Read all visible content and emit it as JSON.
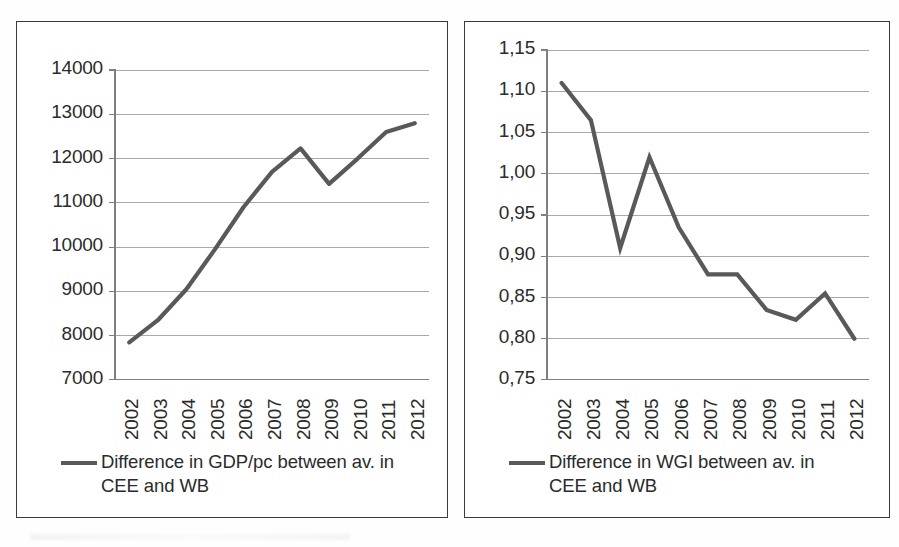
{
  "figure": {
    "background_color": "#ffffff",
    "line_color": "#595959",
    "gridline_color": "#a9a9a9",
    "axis_color": "#7f7f7f",
    "frame_color": "#3a3a3a",
    "text_color": "#2b2b2b"
  },
  "chart_data": [
    {
      "id": "gdp-chart",
      "type": "line",
      "title": "",
      "xlabel": "",
      "ylabel": "",
      "categories": [
        "2002",
        "2003",
        "2004",
        "2005",
        "2006",
        "2007",
        "2008",
        "2009",
        "2010",
        "2011",
        "2012"
      ],
      "series": [
        {
          "name": "Difference in GDP/pc between av. in CEE and WB",
          "values": [
            7850,
            8350,
            9050,
            9950,
            10900,
            11700,
            12230,
            11430,
            12000,
            12600,
            12800
          ]
        }
      ],
      "yticks": [
        7000,
        8000,
        9000,
        10000,
        11000,
        12000,
        13000,
        14000
      ],
      "ytick_labels": [
        "7000",
        "8000",
        "9000",
        "10000",
        "11000",
        "12000",
        "13000",
        "14000"
      ],
      "ylim": [
        7000,
        14000
      ],
      "grid": true,
      "legend_position": "bottom",
      "legend": [
        "Difference in GDP/pc between av. in CEE and WB"
      ]
    },
    {
      "id": "wgi-chart",
      "type": "line",
      "title": "",
      "xlabel": "",
      "ylabel": "",
      "categories": [
        "2002",
        "2003",
        "2004",
        "2005",
        "2006",
        "2007",
        "2008",
        "2009",
        "2010",
        "2011",
        "2012"
      ],
      "series": [
        {
          "name": "Difference in WGI between av. in CEE and WB",
          "values": [
            1.11,
            1.065,
            0.91,
            1.02,
            0.935,
            0.878,
            0.878,
            0.835,
            0.823,
            0.855,
            0.8
          ]
        }
      ],
      "yticks": [
        0.75,
        0.8,
        0.85,
        0.9,
        0.95,
        1.0,
        1.05,
        1.1,
        1.15
      ],
      "ytick_labels": [
        "0,75",
        "0,80",
        "0,85",
        "0,90",
        "0,95",
        "1,00",
        "1,05",
        "1,10",
        "1,15"
      ],
      "ylim": [
        0.75,
        1.15
      ],
      "grid": true,
      "legend_position": "bottom",
      "legend": [
        "Difference in WGI between av. in CEE and WB"
      ]
    }
  ],
  "left_chart": {
    "ytick_labels": [
      "14000",
      "13000",
      "12000",
      "11000",
      "10000",
      "9000",
      "8000",
      "7000"
    ],
    "xtick_labels": [
      "2002",
      "2003",
      "2004",
      "2005",
      "2006",
      "2007",
      "2008",
      "2009",
      "2010",
      "2011",
      "2012"
    ],
    "legend_label": "Difference in GDP/pc between av. in CEE and WB"
  },
  "right_chart": {
    "ytick_labels": [
      "1,15",
      "1,10",
      "1,05",
      "1,00",
      "0,95",
      "0,90",
      "0,85",
      "0,80",
      "0,75"
    ],
    "xtick_labels": [
      "2002",
      "2003",
      "2004",
      "2005",
      "2006",
      "2007",
      "2008",
      "2009",
      "2010",
      "2011",
      "2012"
    ],
    "legend_label": "Difference in WGI between av. in CEE and WB"
  }
}
